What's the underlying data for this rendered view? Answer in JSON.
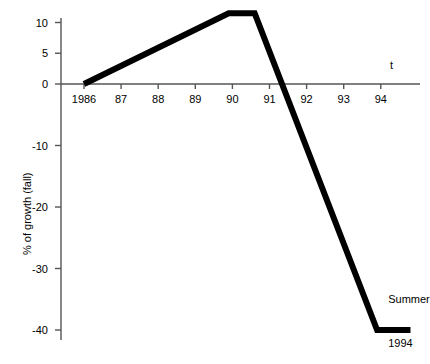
{
  "chart_data": {
    "type": "line",
    "title": "",
    "subtitle": "",
    "xlabel": "t",
    "ylabel": "% of growth (fall)",
    "x_tick_labels": [
      "1986",
      "87",
      "88",
      "89",
      "90",
      "91",
      "92",
      "93",
      "94"
    ],
    "x_tick_values": [
      1986,
      1987,
      1988,
      1989,
      1990,
      1991,
      1992,
      1993,
      1994
    ],
    "y_tick_labels": [
      "10",
      "5",
      "0",
      "-10",
      "-20",
      "-30",
      "-40"
    ],
    "y_tick_values": [
      10,
      5,
      0,
      -10,
      -20,
      -30,
      -40
    ],
    "xlim": [
      1985.4,
      1995.1
    ],
    "ylim": [
      -41.5,
      12.5
    ],
    "grid": false,
    "legend": false,
    "line_color": "#000000",
    "line_width": 6,
    "axis_color": "#555555",
    "series": [
      {
        "name": "Summer",
        "x": [
          1986.0,
          1989.9,
          1990.6,
          1993.9,
          1994.8
        ],
        "y": [
          0,
          11.5,
          11.5,
          -40,
          -40
        ]
      }
    ],
    "annotations": [
      {
        "text": "Summer",
        "x": 1994.2,
        "y": -35.2
      },
      {
        "text": "1994",
        "x": 1994.2,
        "y": -42.2
      }
    ],
    "zero_crossing_x": 1991.1
  },
  "axis_titles": {
    "x": "t",
    "y": "% of growth (fall)"
  }
}
